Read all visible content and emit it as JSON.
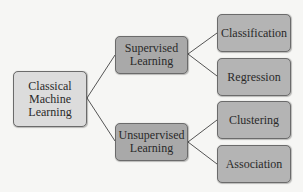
{
  "diagram": {
    "type": "tree",
    "root": {
      "label": "Classical Machine Learning",
      "lines": [
        "Classical",
        "Machine",
        "Learning"
      ]
    },
    "branches": [
      {
        "label": "Supervised Learning",
        "lines": [
          "Supervised",
          "Learning"
        ],
        "children": [
          {
            "label": "Classification"
          },
          {
            "label": "Regression"
          }
        ]
      },
      {
        "label": "Unsupervised Learning",
        "lines": [
          "Unsupervised",
          "Learning"
        ],
        "children": [
          {
            "label": "Clustering"
          },
          {
            "label": "Association"
          }
        ]
      }
    ],
    "colors": {
      "root_fill": "#dcdcdc",
      "branch_fill": "#a9a9a9",
      "leaf_fill": "#b4b4b4",
      "border": "#6b6b6b",
      "connector": "#555555",
      "background": "#f6f6f4"
    }
  }
}
